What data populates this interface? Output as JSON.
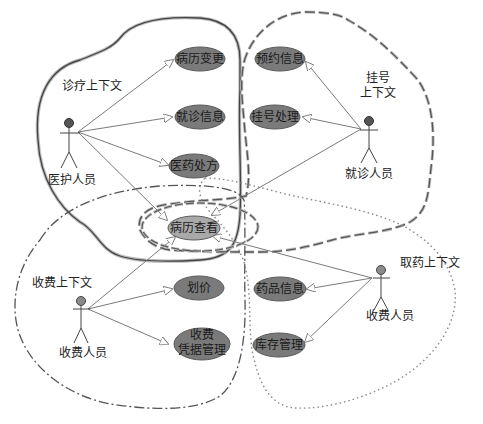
{
  "diagram": {
    "type": "use-case-bounded-contexts",
    "colors": {
      "usecase_fill": "#7a7a7a",
      "usecase_shared_fill": "#a9a9a9",
      "usecase_stroke": "#5a5a5a",
      "actor_head_dark": "#555555",
      "actor_head_light": "#8a8a8a",
      "line": "#7a7a7a",
      "boundary": "#555555"
    },
    "contexts": [
      {
        "id": "clinical",
        "label": "诊疗上下文",
        "style": "solid-double"
      },
      {
        "id": "registration",
        "label_line1": "挂号",
        "label_line2": "上下文",
        "style": "dashed-double"
      },
      {
        "id": "billing",
        "label": "收费上下文",
        "style": "dash-dot"
      },
      {
        "id": "pharmacy",
        "label": "取药上下文",
        "style": "dotted"
      }
    ],
    "actors": [
      {
        "id": "medical_staff",
        "label": "医护人员"
      },
      {
        "id": "patient",
        "label": "就诊人员"
      },
      {
        "id": "cashier_billing",
        "label": "收费人员"
      },
      {
        "id": "cashier_pharmacy",
        "label": "收费人员"
      }
    ],
    "use_cases": [
      {
        "id": "record_change",
        "label": "病历变更"
      },
      {
        "id": "visit_info",
        "label": "就诊信息"
      },
      {
        "id": "prescription",
        "label": "医药处方"
      },
      {
        "id": "record_view",
        "label": "病历查看"
      },
      {
        "id": "appointment_info",
        "label": "预约信息"
      },
      {
        "id": "registration_proc",
        "label": "挂号处理"
      },
      {
        "id": "pricing",
        "label": "划价"
      },
      {
        "id": "receipt_mgmt_line1",
        "label": "收费"
      },
      {
        "id": "receipt_mgmt_line2",
        "label": "凭据管理"
      },
      {
        "id": "drug_info",
        "label": "药品信息"
      },
      {
        "id": "inventory_mgmt",
        "label": "库存管理"
      }
    ],
    "associations": [
      {
        "from": "医护人员",
        "to": "病历变更"
      },
      {
        "from": "医护人员",
        "to": "就诊信息"
      },
      {
        "from": "医护人员",
        "to": "医药处方"
      },
      {
        "from": "医护人员",
        "to": "病历查看"
      },
      {
        "from": "就诊人员",
        "to": "预约信息"
      },
      {
        "from": "就诊人员",
        "to": "挂号处理"
      },
      {
        "from": "就诊人员",
        "to": "病历查看"
      },
      {
        "from": "收费人员",
        "to": "病历查看"
      },
      {
        "from": "收费人员",
        "to": "划价"
      },
      {
        "from": "收费人员",
        "to": "收费凭据管理"
      },
      {
        "from": "收费人员(取药)",
        "to": "病历查看"
      },
      {
        "from": "收费人员(取药)",
        "to": "药品信息"
      },
      {
        "from": "收费人员(取药)",
        "to": "库存管理"
      }
    ]
  }
}
